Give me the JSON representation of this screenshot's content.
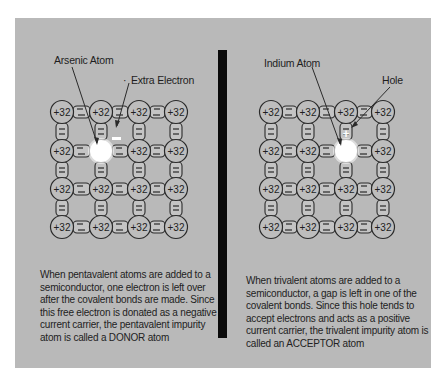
{
  "left": {
    "labels": {
      "atom": "Arsenic Atom",
      "extra": "Extra Electron",
      "dot": "·"
    },
    "atom_charge": "+32",
    "grid": {
      "cols": 4,
      "rows": 4,
      "impurity": {
        "col": 1,
        "row": 1
      }
    },
    "caption": "When pentavalent atoms are added to a semiconductor, one electron is left over after the covalent bonds are made. Since this free electron is donated as a negative current carrier, the pentavalent impurity atom is called a DONOR atom"
  },
  "right": {
    "labels": {
      "atom": "Indium Atom",
      "hole": "Hole",
      "plus": "+"
    },
    "atom_charge": "+32",
    "grid": {
      "cols": 4,
      "rows": 4,
      "impurity": {
        "col": 2,
        "row": 1
      }
    },
    "caption": "When trivalent atoms are added to a semiconductor, a gap is left in one of the covalent bonds. Since this hole tends to accept electrons and acts as a positive current carrier, the trivalent impurity atom is called an ACCEPTOR atom"
  },
  "colors": {
    "background": "#b9b9b9",
    "divider": "#0a0a0a",
    "impurity": "#ffffff",
    "line": "#2a2a2a"
  }
}
